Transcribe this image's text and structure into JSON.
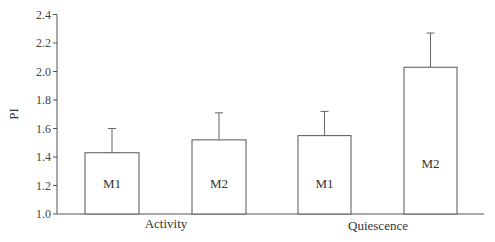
{
  "chart_data": {
    "type": "bar",
    "title": "",
    "xlabel": "",
    "ylabel": "PI",
    "ylim": [
      1.0,
      2.4
    ],
    "yticks": [
      "1.0",
      "1.2",
      "1.4",
      "1.6",
      "1.8",
      "2.0",
      "2.2",
      "2.4"
    ],
    "grid": false,
    "legend": null,
    "groups": [
      "Activity",
      "Quiescence"
    ],
    "bars": [
      {
        "group": "Activity",
        "label": "M1",
        "value": 1.43,
        "error_upper": 1.6
      },
      {
        "group": "Activity",
        "label": "M2",
        "value": 1.52,
        "error_upper": 1.71
      },
      {
        "group": "Quiescence",
        "label": "M1",
        "value": 1.55,
        "error_upper": 1.72
      },
      {
        "group": "Quiescence",
        "label": "M2",
        "value": 2.03,
        "error_upper": 2.27
      }
    ],
    "series": [
      {
        "name": "M1",
        "values": [
          1.43,
          1.55
        ],
        "error_upper": [
          1.6,
          1.72
        ]
      },
      {
        "name": "M2",
        "values": [
          1.52,
          2.03
        ],
        "error_upper": [
          1.71,
          2.27
        ]
      }
    ],
    "categories": [
      "Activity",
      "Quiescence"
    ]
  },
  "axis": {
    "ylabel": "PI",
    "categories": [
      "Activity",
      "Quiescence"
    ]
  }
}
